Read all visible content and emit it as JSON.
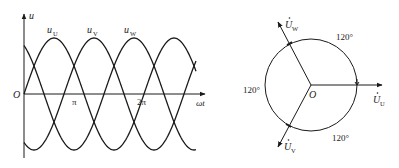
{
  "waveform": {
    "y_axis_label": "u",
    "x_axis_label": "ωt",
    "origin_label": "O",
    "ticks": [
      {
        "label": "π",
        "x": 75
      },
      {
        "label": "2π",
        "x": 143
      }
    ],
    "curves": [
      {
        "name": "u",
        "sub": "U",
        "phase_deg": 0
      },
      {
        "name": "u",
        "sub": "V",
        "phase_deg": -120
      },
      {
        "name": "u",
        "sub": "W",
        "phase_deg": 120
      }
    ],
    "stroke_color": "#1a1a1a"
  },
  "phasor": {
    "origin_label": "O",
    "vectors": [
      {
        "name": "U",
        "sub": "U",
        "angle_deg": 0
      },
      {
        "name": "U",
        "sub": "V",
        "angle_deg": -120
      },
      {
        "name": "U",
        "sub": "W",
        "angle_deg": 120
      }
    ],
    "angle_labels": [
      "120°",
      "120°",
      "120°"
    ],
    "stroke_color": "#1a1a1a"
  }
}
